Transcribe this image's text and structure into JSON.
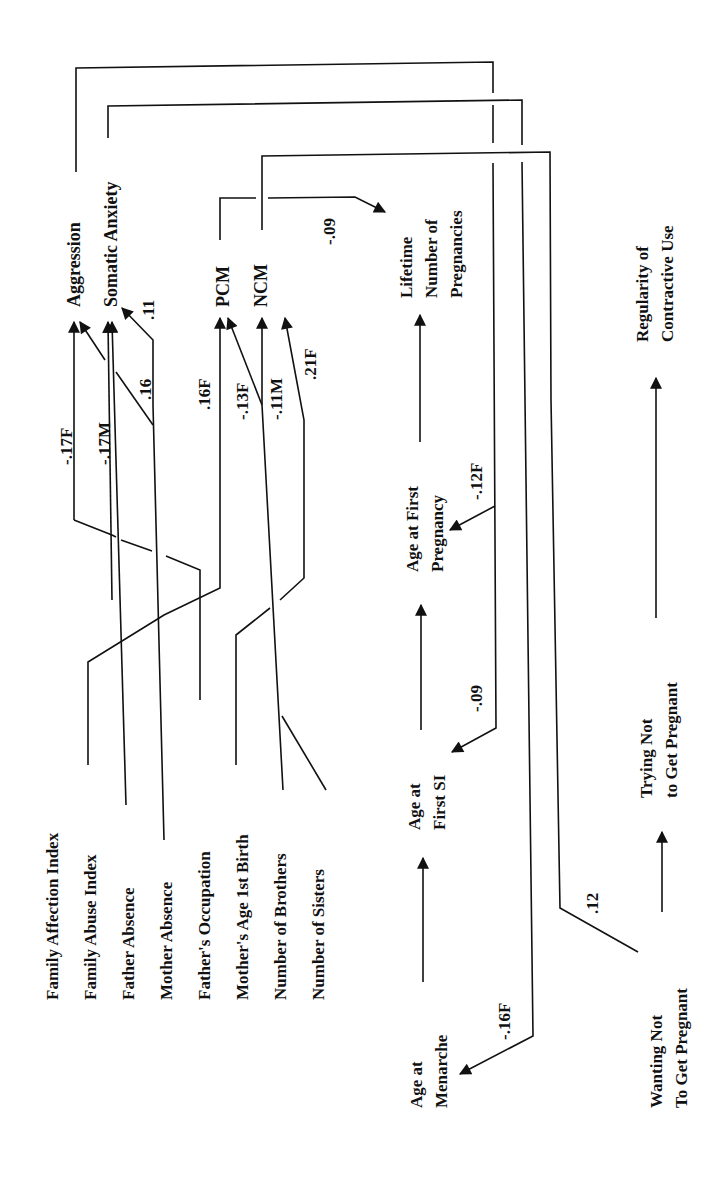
{
  "figure": {
    "orientation": "rotated-90-ccw",
    "nodes": {
      "family_affection_index": "Family Affection Index",
      "family_abuse_index": "Family Abuse Index",
      "father_absence": "Father Absence",
      "mother_absence": "Mother Absence",
      "fathers_occupation": "Father's Occupation",
      "mothers_age_1st_birth": "Mother's Age 1st Birth",
      "number_of_brothers": "Number of Brothers",
      "number_of_sisters": "Number of Sisters",
      "aggression": "Aggression",
      "somatic_anxiety": "Somatic Anxiety",
      "pcm": "PCM",
      "ncm": "NCM",
      "lifetime_pregnancies": [
        "Lifetime",
        "Number of",
        "Pregnancies"
      ],
      "age_at_first_pregnancy": [
        "Age at First",
        "Pregnancy"
      ],
      "age_at_first_si": [
        "Age at",
        "First SI"
      ],
      "age_at_menarche": [
        "Age at",
        "Menarche"
      ],
      "regularity_contraceptive": [
        "Regularity of",
        "Contractive Use"
      ],
      "trying_not_pregnant": [
        "Trying Not",
        "to Get Pregnant"
      ],
      "wanting_not_pregnant": [
        "Wanting Not",
        "To Get Pregnant"
      ]
    },
    "edges": [
      {
        "from": "Family Abuse Index",
        "to": "Aggression",
        "coef": "-.17F"
      },
      {
        "from": "Father Absence",
        "to": "Aggression",
        "coef": "-.17M"
      },
      {
        "from": "Mother Absence",
        "to": "Somatic Anxiety",
        "coef": ".16"
      },
      {
        "from": "Mother Absence",
        "to": "Somatic Anxiety",
        "coef": ".11"
      },
      {
        "from": "Family Affection Index",
        "to": "PCM",
        "coef": ".16F"
      },
      {
        "from": "Number of Brothers",
        "to": "PCM",
        "coef": "-.13F"
      },
      {
        "from": "Number of Brothers",
        "to": "NCM",
        "coef": "-.11M"
      },
      {
        "from": "Mother's Age 1st Birth",
        "to": "NCM",
        "coef": ".21F"
      },
      {
        "from": "PCM",
        "to": "Lifetime Number of Pregnancies",
        "coef": "-.09"
      },
      {
        "from": "Aggression",
        "to": "Age at First Pregnancy",
        "coef": "-.12F"
      },
      {
        "from": "Aggression",
        "to": "Age at First SI",
        "coef": "-.09"
      },
      {
        "from": "Somatic Anxiety",
        "to": "Age at Menarche",
        "coef": "-.16F"
      },
      {
        "from": "NCM",
        "to": "Wanting Not To Get Pregnant",
        "coef": ".12"
      },
      {
        "from": "Age at Menarche",
        "to": "Age at First SI",
        "coef": ""
      },
      {
        "from": "Age at First SI",
        "to": "Age at First Pregnancy",
        "coef": ""
      },
      {
        "from": "Age at First Pregnancy",
        "to": "Lifetime Number of Pregnancies",
        "coef": ""
      },
      {
        "from": "Wanting Not To Get Pregnant",
        "to": "Trying Not to Get Pregnant",
        "coef": ""
      },
      {
        "from": "Trying Not to Get Pregnant",
        "to": "Regularity of Contractive Use",
        "coef": ""
      }
    ]
  }
}
